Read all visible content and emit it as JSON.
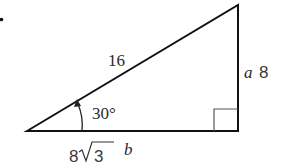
{
  "diagram": {
    "type": "right-triangle",
    "bullet": "•",
    "hypotenuse": {
      "value": "16"
    },
    "opposite_side": {
      "variable": "a",
      "value": "8"
    },
    "adjacent_side": {
      "variable": "b",
      "value": "8√3",
      "value_coefficient": "8",
      "value_radicand": "3"
    },
    "angle": {
      "value": "30°"
    },
    "right_angle_marker": true,
    "colors": {
      "line": "#111111",
      "text": "#333333",
      "background": "#ffffff"
    }
  }
}
